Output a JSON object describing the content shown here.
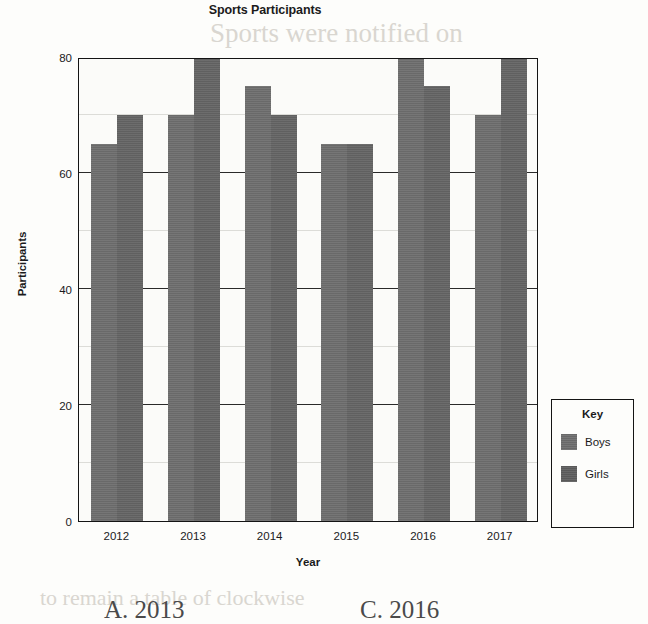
{
  "chart_data": {
    "type": "bar",
    "title": "Sports Participants",
    "xlabel": "Year",
    "ylabel": "Participants",
    "categories": [
      "2012",
      "2013",
      "2014",
      "2015",
      "2016",
      "2017"
    ],
    "series": [
      {
        "name": "Boys",
        "values": [
          65,
          70,
          75,
          65,
          80,
          70
        ],
        "color": "#6f6f6f"
      },
      {
        "name": "Girls",
        "values": [
          70,
          80,
          70,
          65,
          75,
          80
        ],
        "color": "#5f5f5f"
      }
    ],
    "ylim": [
      0,
      80
    ],
    "yticks": [
      0,
      20,
      40,
      60,
      80
    ],
    "ytick_labels": [
      "0",
      "20",
      "40",
      "60",
      "80"
    ],
    "minor_yticks": [
      10,
      30,
      50,
      70
    ],
    "grid": true,
    "legend_position": "bottom-right",
    "legend_title": "Key"
  },
  "legend": {
    "title": "Key",
    "items": [
      {
        "label": "Boys"
      },
      {
        "label": "Girls"
      }
    ]
  },
  "answers": {
    "choice_a": "A.  2013",
    "choice_c": "C.  2016"
  },
  "ghost_text": {
    "line1": "Sports were notified on",
    "line2": "the summer equinox here",
    "line3": "wearing the bright value",
    "line4": "the shortest of the year",
    "line5": "to remain a table of clockwise"
  }
}
